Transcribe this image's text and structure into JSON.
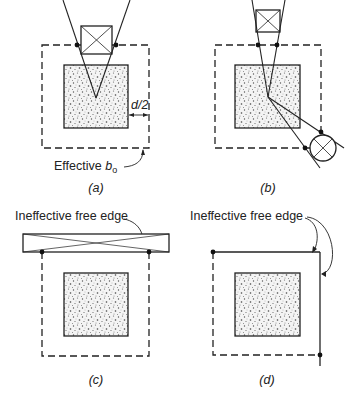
{
  "figure": {
    "panels": [
      {
        "id": "a",
        "caption": "(a)",
        "annotations": {
          "dimension": "d/2",
          "perimeter_label_prefix": "Effective ",
          "perimeter_label_var": "b",
          "perimeter_label_sub": "o"
        }
      },
      {
        "id": "b",
        "caption": "(b)"
      },
      {
        "id": "c",
        "caption": "(c)",
        "annotations": {
          "edge_label": "Ineffective free edge"
        }
      },
      {
        "id": "d",
        "caption": "(d)",
        "annotations": {
          "edge_label": "Ineffective free edge"
        }
      }
    ],
    "colors": {
      "line": "#222222",
      "fill_stipple": "#f2f2f2",
      "background": "#ffffff"
    }
  }
}
